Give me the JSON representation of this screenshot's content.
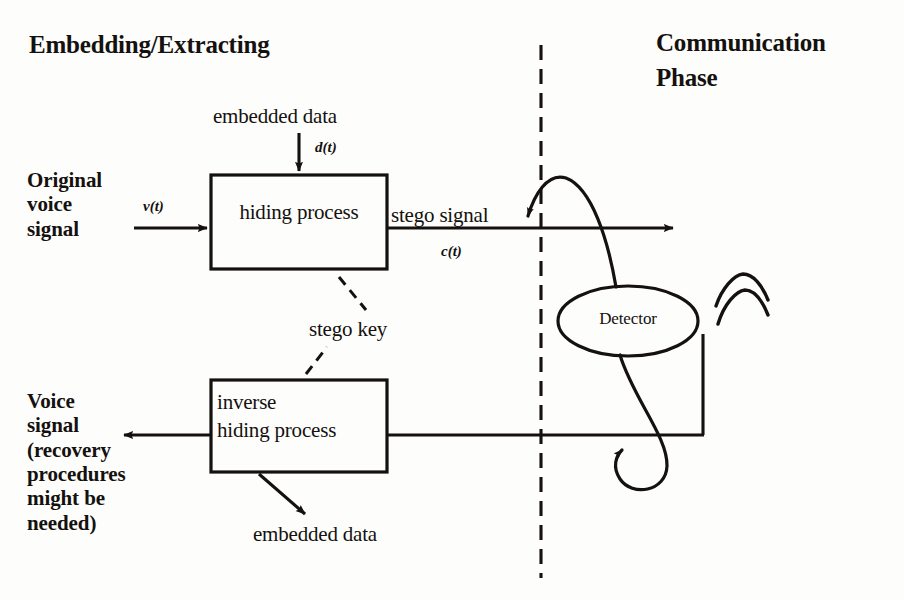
{
  "figure": {
    "type": "block-diagram",
    "topic": "Voice data hiding / steganography system",
    "background_color": "#fdfdfb",
    "ink_color": "#14110f"
  },
  "headings": {
    "left": "Embedding/Extracting",
    "right_line1": "Communication",
    "right_line2": "Phase"
  },
  "blocks": {
    "hiding": {
      "label": "hiding process",
      "x": 211,
      "y": 175,
      "w": 176,
      "h": 94
    },
    "inverse": {
      "label_line1": "inverse",
      "label_line2": "hiding process",
      "x": 211,
      "y": 380,
      "w": 176,
      "h": 92
    },
    "detector": {
      "label": "Detector",
      "cx": 628,
      "cy": 321,
      "rx": 70,
      "ry": 35
    }
  },
  "labels": {
    "original_voice_signal": "Original\nvoice\nsignal",
    "embedded_data_top": "embedded data",
    "embedded_data_bottom": "embedded data",
    "stego_signal": "stego signal",
    "stego_key": "stego key",
    "voice_signal_recovery": "Voice\nsignal\n(recovery\nprocedures\nmight be\nneeded)"
  },
  "signals": {
    "input_voice": "v(t)",
    "embedded_data": "d(t)",
    "stego": "c(t)"
  },
  "separator": {
    "name": "phase-divider",
    "style": "dash-dot vertical",
    "x": 541,
    "y_top": 45,
    "y_bottom": 578
  },
  "connections": [
    {
      "name": "embedded-data-into-hiding",
      "from": "embedded data",
      "to": "hiding process",
      "style": "solid-arrow"
    },
    {
      "name": "voice-into-hiding",
      "from": "Original voice signal",
      "to": "hiding process",
      "style": "solid-arrow"
    },
    {
      "name": "stego-channel",
      "from": "hiding process",
      "to": "communication channel",
      "style": "solid-arrow"
    },
    {
      "name": "stego-key-to-hiding",
      "from": "stego key",
      "to": "hiding process",
      "style": "dash-dot"
    },
    {
      "name": "stego-key-to-inverse",
      "from": "stego key",
      "to": "inverse hiding process",
      "style": "dash-dot"
    },
    {
      "name": "channel-into-inverse",
      "from": "communication channel",
      "to": "inverse hiding process",
      "style": "solid"
    },
    {
      "name": "inverse-to-voice",
      "from": "inverse hiding process",
      "to": "Voice signal (recovery procedures might be needed)",
      "style": "solid-arrow"
    },
    {
      "name": "inverse-to-embedded-data",
      "from": "inverse hiding process",
      "to": "embedded data",
      "style": "solid-arrow"
    },
    {
      "name": "detector-tap-upper",
      "from": "Detector",
      "to": "stego channel",
      "style": "curved-arrow"
    },
    {
      "name": "detector-tap-lower",
      "from": "Detector",
      "to": "return channel",
      "style": "curved-arrow"
    }
  ],
  "antenna": {
    "name": "antenna-icon",
    "arcs": 2,
    "x": 735,
    "y": 300
  }
}
